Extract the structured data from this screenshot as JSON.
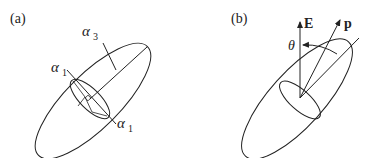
{
  "panels": [
    {
      "label": "(a)",
      "axes": {
        "major": "α",
        "major_sub": "3",
        "minor_top": "α",
        "minor_top_sub": "1",
        "minor_bottom": "α",
        "minor_bottom_sub": "1"
      }
    },
    {
      "label": "(b)",
      "vectors": {
        "field": "E",
        "dipole": "p"
      },
      "angle": "θ"
    }
  ],
  "colors": {
    "stroke": "#222222",
    "background": "#ffffff"
  }
}
